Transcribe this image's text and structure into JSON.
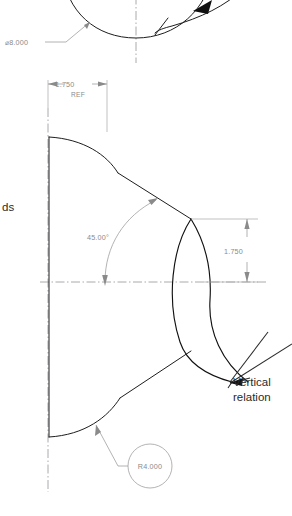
{
  "drawing": {
    "title": "Technical CAD Drawing Sketch",
    "background_color": "#ffffff",
    "model_line_color": "#1d1d1d",
    "dimension_color": "#8a8a8a",
    "annotation_color": "#2b2b2b",
    "centerline_color": "#8f8f96"
  },
  "top_view": {
    "diameter_dimension": {
      "label": "⌀8.000",
      "value": "8.000",
      "symbol": "⌀",
      "type": "diameter"
    }
  },
  "bottom_view": {
    "width_dimension": {
      "value": "1.750",
      "qualifier": "REF",
      "type": "linear-horizontal"
    },
    "angle_dimension": {
      "value": "45.00°",
      "type": "angular"
    },
    "height_dimension": {
      "value": "1.750",
      "type": "linear-vertical"
    },
    "radius_callout": {
      "label": "R4.000",
      "value": "4.000",
      "symbol": "R",
      "type": "radius"
    }
  },
  "annotations": {
    "vertical_relation": {
      "line1": "Vertical",
      "line2": "relation"
    },
    "clipped_left_label": {
      "text": "ds"
    }
  }
}
